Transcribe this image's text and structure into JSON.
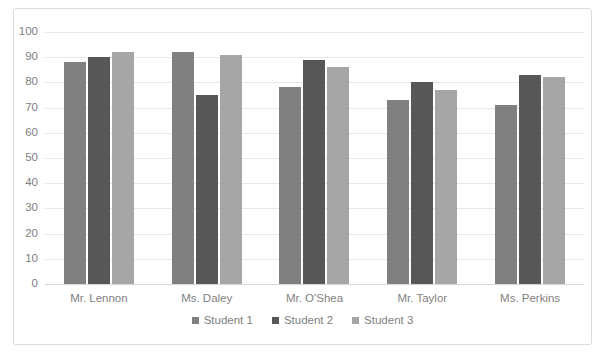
{
  "chart_data": {
    "type": "bar",
    "title": "",
    "xlabel": "",
    "ylabel": "",
    "ylim": [
      0,
      100
    ],
    "ytick_step": 10,
    "grid": true,
    "legend_position": "bottom",
    "categories": [
      "Mr. Lennon",
      "Ms. Daley",
      "Mr. O'Shea",
      "Mr. Taylor",
      "Ms. Perkins"
    ],
    "ytick_labels": [
      "100",
      "90",
      "80",
      "70",
      "60",
      "50",
      "40",
      "30",
      "20",
      "10",
      "0"
    ],
    "series": [
      {
        "name": "Student 1",
        "color": "#808080",
        "values": [
          88,
          92,
          78,
          73,
          71
        ]
      },
      {
        "name": "Student 2",
        "color": "#575757",
        "values": [
          90,
          75,
          89,
          80,
          83
        ]
      },
      {
        "name": "Student 3",
        "color": "#a6a6a6",
        "values": [
          92,
          91,
          86,
          77,
          82
        ]
      }
    ]
  },
  "frame": {
    "border_color": "#dcdcdc",
    "background": "#ffffff",
    "gridline_color": "#e8e8e8",
    "axis_text_color": "#7f7f7f"
  }
}
